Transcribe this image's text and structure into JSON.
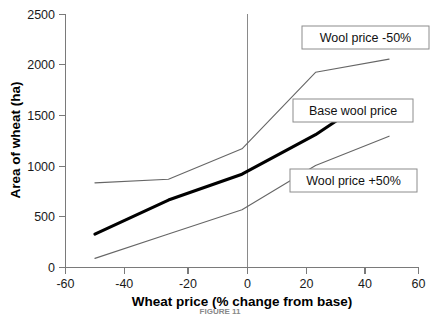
{
  "chart_data": {
    "type": "line",
    "title": "",
    "xlabel": "Wheat price (% change from base)",
    "ylabel": "Area of wheat (ha)",
    "xlim": [
      -60,
      60
    ],
    "ylim": [
      0,
      2500
    ],
    "xticks": [
      -60,
      -40,
      -20,
      0,
      20,
      40,
      60
    ],
    "xtick_labels": [
      "-60",
      "-40",
      "-20",
      "0",
      "20",
      "40",
      "60"
    ],
    "yticks": [
      0,
      500,
      1000,
      1500,
      2000,
      2500
    ],
    "ytick_labels": [
      "0",
      "500",
      "1000",
      "1500",
      "2000",
      "2500"
    ],
    "grid": false,
    "legend_position": "inline-callouts",
    "reference_line_x": 0,
    "series": [
      {
        "name": "Wool price -50%",
        "style": "thin",
        "color": "#666666",
        "x": [
          -50,
          -25,
          0,
          25,
          50
        ],
        "values": [
          835,
          870,
          1170,
          1925,
          2055
        ]
      },
      {
        "name": "Base wool price",
        "style": "thick",
        "color": "#000000",
        "x": [
          -50,
          -25,
          0,
          25,
          33
        ],
        "values": [
          330,
          665,
          920,
          1310,
          1465
        ]
      },
      {
        "name": "Wool price +50%",
        "style": "thin",
        "color": "#666666",
        "x": [
          -50,
          -25,
          0,
          25,
          50
        ],
        "values": [
          90,
          330,
          570,
          1005,
          1295
        ]
      }
    ],
    "annotations": [
      {
        "label": "Wool price -50%",
        "x_px": 365,
        "y_px": 38
      },
      {
        "label": "Base wool price",
        "x_px": 352,
        "y_px": 110
      },
      {
        "label": "Wool price +50%",
        "x_px": 352,
        "y_px": 180
      }
    ]
  },
  "caption": "FIGURE 11"
}
